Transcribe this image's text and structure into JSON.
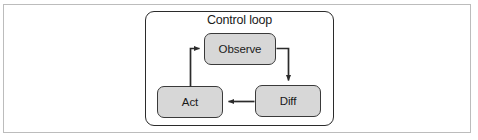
{
  "figure": {
    "group_title": "Control loop",
    "nodes": [
      {
        "id": "observe",
        "label": "Observe"
      },
      {
        "id": "diff",
        "label": "Diff"
      },
      {
        "id": "act",
        "label": "Act"
      }
    ],
    "edges": [
      {
        "id": "observe-to-diff",
        "from": "Observe",
        "to": "Diff"
      },
      {
        "id": "diff-to-act",
        "from": "Diff",
        "to": "Act"
      },
      {
        "id": "act-to-observe",
        "from": "Act",
        "to": "Observe"
      }
    ],
    "colors": {
      "node_fill": "#d7d7d7",
      "node_border": "#3a3a3a",
      "group_border": "#2b2b2b",
      "frame_border": "#bcbcbc",
      "connector": "#2b2b2b",
      "text": "#1a1a1a",
      "background": "#ffffff"
    }
  }
}
